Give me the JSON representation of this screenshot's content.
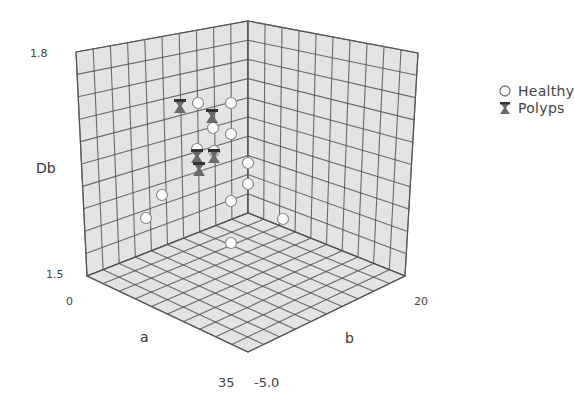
{
  "chart_data": {
    "type": "scatter",
    "subtype": "3d-scatter",
    "title": "",
    "axes": {
      "x": {
        "label": "a",
        "min_label": "0",
        "max_label": "35",
        "range": [
          0,
          35
        ]
      },
      "y": {
        "label": "b",
        "min_label": "-5.0",
        "max_label": "20",
        "range": [
          -5.0,
          20
        ]
      },
      "z": {
        "label": "Db",
        "min_label": "1.5",
        "max_label": "1.8",
        "range": [
          1.5,
          1.8
        ]
      }
    },
    "grid": true,
    "grid_divisions": 10,
    "legend_position": "right",
    "legend": [
      {
        "name": "Healthy",
        "marker": "circle"
      },
      {
        "name": "Polyps",
        "marker": "hourglass"
      }
    ],
    "series": [
      {
        "name": "Healthy",
        "marker": "circle",
        "screen_points": [
          [
            198,
            103
          ],
          [
            231,
            103
          ],
          [
            213,
            128
          ],
          [
            231,
            134
          ],
          [
            197,
            149
          ],
          [
            214,
            151
          ],
          [
            162,
            195
          ],
          [
            248,
            163
          ],
          [
            248,
            184
          ],
          [
            231,
            201
          ],
          [
            146,
            218
          ],
          [
            283,
            219
          ],
          [
            231,
            243
          ]
        ]
      },
      {
        "name": "Polyps",
        "marker": "hourglass",
        "screen_points": [
          [
            180,
            106
          ],
          [
            212,
            116
          ],
          [
            197,
            156
          ],
          [
            214,
            156
          ],
          [
            199,
            169
          ]
        ]
      }
    ]
  },
  "colors": {
    "grid_fill": "#e3e3e3",
    "grid_line": "#555555",
    "healthy_fill": "#ffffff",
    "healthy_stroke": "#888888",
    "polyps_fill": "#555555",
    "background": "#ffffff"
  },
  "labels": {
    "z_max": "1.8",
    "z_min": "1.5",
    "z_axis": "Db",
    "x_min": "0",
    "x_axis": "a",
    "x_max": "35",
    "y_min": "-5.0",
    "y_axis": "b",
    "y_max": "20"
  },
  "legend": {
    "healthy": "Healthy",
    "polyps": "Polyps"
  }
}
